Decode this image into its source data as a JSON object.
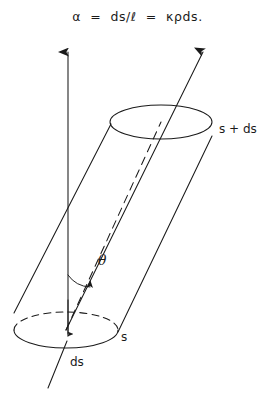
{
  "figure": {
    "caption_formula": "α  =  ds/ℓ  =  κρds.",
    "background_color": "#ffffff",
    "ink_color": "#1a1a1a",
    "labels": {
      "top_face": "s + ds",
      "bottom_face": "s",
      "thickness": "ds",
      "angle": "θ"
    },
    "icons": {
      "vertical_axis": "up-arrow-icon",
      "tilted_axis": "up-right-arrow-icon",
      "thickness_pointer": "down-arrow-icon",
      "angle_arc": "arc-arrow-icon"
    },
    "geometry": {
      "top_ellipse": {
        "cx": 161,
        "cy": 122,
        "rx": 51,
        "ry": 17
      },
      "bottom_ellipse": {
        "cx": 66,
        "cy": 330,
        "rx": 52,
        "ry": 18
      },
      "vertical_arrow": {
        "x": 68,
        "y_tip": 46,
        "y_tail": 336
      },
      "tilted_arrow": {
        "x_tip": 206,
        "y_tip": 46,
        "x_tail": 66,
        "y_tail": 330
      },
      "angle_deg": 24
    }
  }
}
